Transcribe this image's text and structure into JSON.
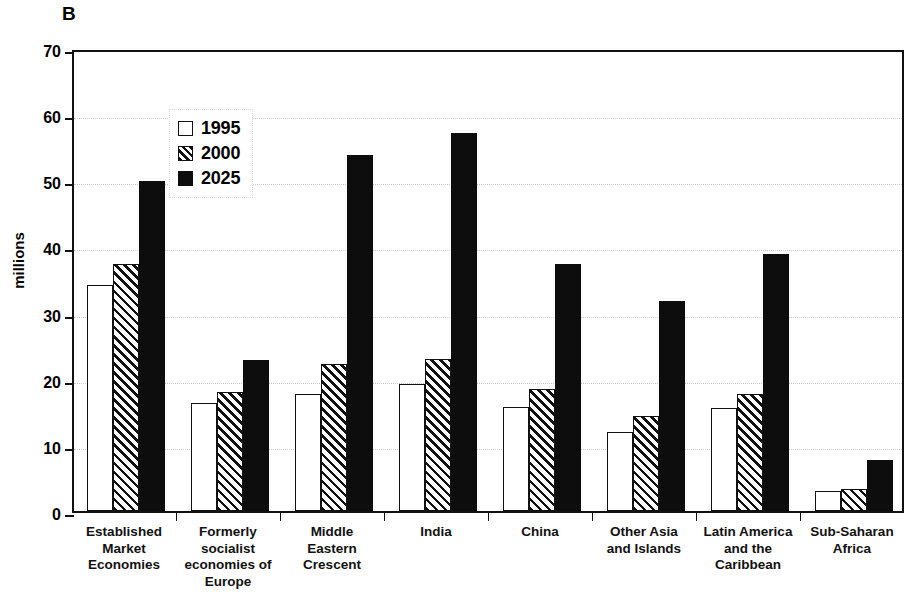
{
  "figure": {
    "panel_label": "B"
  },
  "chart_data": {
    "type": "bar",
    "title": "",
    "subtitle": "",
    "xlabel": "",
    "ylabel": "millions",
    "ylim": [
      0,
      70
    ],
    "ytick_step": 10,
    "yticks": [
      0,
      10,
      20,
      30,
      40,
      50,
      60,
      70
    ],
    "ytick_labels": [
      "0",
      "10",
      "20",
      "30",
      "40",
      "50",
      "60",
      "70"
    ],
    "grid": true,
    "grid_axis": "y",
    "legend_position": "upper-left-inside",
    "categories": [
      "Established Market Economies",
      "Formerly socialist economies of Europe",
      "Middle Eastern Crescent",
      "India",
      "China",
      "Other Asia and Islands",
      "Latin America and the Caribbean",
      "Sub-Saharan Africa"
    ],
    "category_label_lines": [
      [
        "Established",
        "Market",
        "Economies"
      ],
      [
        "Formerly",
        "socialist",
        "economies of",
        "Europe"
      ],
      [
        "Middle",
        "Eastern",
        "Crescent"
      ],
      [
        "India"
      ],
      [
        "China"
      ],
      [
        "Other Asia",
        "and Islands"
      ],
      [
        "Latin America",
        "and the",
        "Caribbean"
      ],
      [
        "Sub-Saharan",
        "Africa"
      ]
    ],
    "series": [
      {
        "name": "1995",
        "fill": "white",
        "values": [
          34.1,
          16.3,
          17.7,
          19.2,
          15.7,
          12.0,
          15.6,
          3.0
        ]
      },
      {
        "name": "2000",
        "fill": "diagonal-hatch",
        "values": [
          37.4,
          18.0,
          22.3,
          23.0,
          18.4,
          14.4,
          17.7,
          3.3
        ]
      },
      {
        "name": "2025",
        "fill": "black",
        "values": [
          49.9,
          22.8,
          53.9,
          57.2,
          37.3,
          31.8,
          38.8,
          7.7
        ]
      }
    ]
  },
  "legend": {
    "entries": [
      {
        "label": "1995",
        "fill": "white"
      },
      {
        "label": "2000",
        "fill": "diagonal-hatch"
      },
      {
        "label": "2025",
        "fill": "black"
      }
    ]
  },
  "colors": {
    "axis": "#111111",
    "grid": "#c9c9c9",
    "bar_1995": "#ffffff",
    "bar_2000_hatch": "#111111",
    "bar_2025": "#0d0d0d",
    "background": "#ffffff"
  }
}
